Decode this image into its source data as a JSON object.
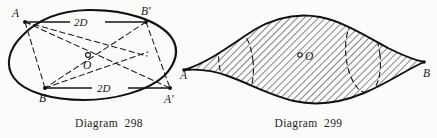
{
  "page": {
    "background_color": "#fbfbf9",
    "ink_color": "#141414"
  },
  "figures": [
    {
      "id": "diagram-298",
      "caption": "Diagram  298",
      "description": "Ellipse with inscribed quadrilateral A B' A' B and centre O",
      "vertex_labels": {
        "top_left": "A",
        "top_right": "B'",
        "bottom_left": "B",
        "bottom_right": "A'",
        "centre": "O"
      },
      "dimension_labels": {
        "top": "2D",
        "bottom": "2D"
      }
    },
    {
      "id": "diagram-299",
      "caption": "Diagram  299",
      "description": "Hatched lens-shaped solid of revolution with dashed elliptical sections, points A and B on the axis and centre O",
      "vertex_labels": {
        "left": "A",
        "right": "B",
        "centre": "O"
      }
    }
  ]
}
